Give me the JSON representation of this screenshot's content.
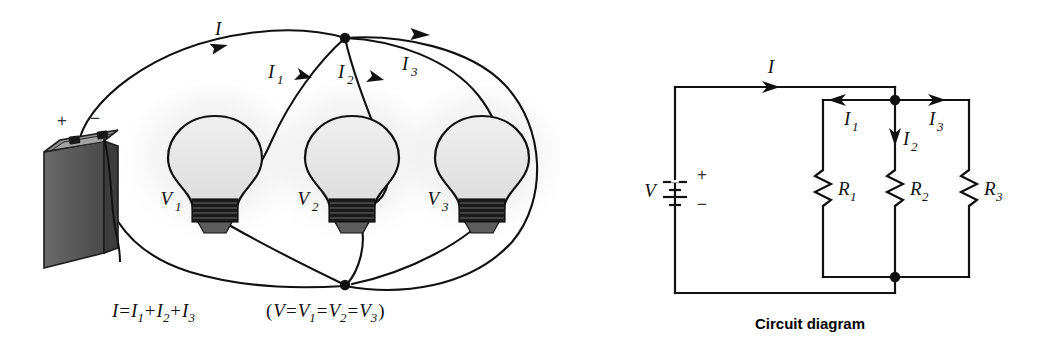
{
  "figure": {
    "background_color": "#ffffff",
    "line_color": "#111111"
  },
  "pictorial": {
    "name": "pictorial-view",
    "battery": {
      "label_plus": "+",
      "label_minus": "−",
      "body_color": "#595959",
      "top_color": "#8a8a8a",
      "side_color": "#3f3f3f"
    },
    "current_labels": [
      {
        "name": "current-I",
        "text": "I",
        "sub": ""
      },
      {
        "name": "current-I1",
        "text": "I",
        "sub": "1"
      },
      {
        "name": "current-I2",
        "text": "I",
        "sub": "2"
      },
      {
        "name": "current-I3",
        "text": "I",
        "sub": "3"
      }
    ],
    "bulbs": [
      {
        "name": "bulb-1",
        "label": "V",
        "sub": "1",
        "glass_color": "#e9e9e9",
        "base_color": "#1a1a1a"
      },
      {
        "name": "bulb-2",
        "label": "V",
        "sub": "2",
        "glass_color": "#e9e9e9",
        "base_color": "#1a1a1a"
      },
      {
        "name": "bulb-3",
        "label": "V",
        "sub": "3",
        "glass_color": "#e9e9e9",
        "base_color": "#1a1a1a"
      }
    ],
    "equations": {
      "current": {
        "lhs": "I",
        "eq": "=",
        "terms": [
          "I",
          "I",
          "I"
        ],
        "subs": [
          "1",
          "2",
          "3"
        ],
        "plus": "+"
      },
      "voltage": {
        "open": "(",
        "lhs": "V",
        "eq": "=",
        "terms": [
          "V",
          "V",
          "V"
        ],
        "subs": [
          "1",
          "2",
          "3"
        ],
        "close": ")"
      }
    }
  },
  "schematic": {
    "name": "circuit-diagram",
    "caption": "Circuit diagram",
    "source": {
      "name": "voltage-source",
      "label": "V",
      "plus": "+",
      "minus": "−"
    },
    "current_labels": [
      {
        "name": "current-I",
        "text": "I",
        "sub": ""
      },
      {
        "name": "current-I1",
        "text": "I",
        "sub": "1"
      },
      {
        "name": "current-I2",
        "text": "I",
        "sub": "2"
      },
      {
        "name": "current-I3",
        "text": "I",
        "sub": "3"
      }
    ],
    "resistors": [
      {
        "name": "resistor-R1",
        "label": "R",
        "sub": "1"
      },
      {
        "name": "resistor-R2",
        "label": "R",
        "sub": "2"
      },
      {
        "name": "resistor-R3",
        "label": "R",
        "sub": "3"
      }
    ],
    "nodes": [
      {
        "name": "junction-top",
        "x": 895,
        "y": 100
      },
      {
        "name": "junction-bottom",
        "x": 895,
        "y": 277
      }
    ]
  }
}
